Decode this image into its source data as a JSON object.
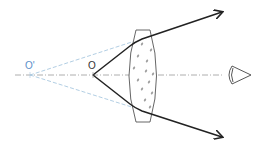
{
  "diagram": {
    "type": "optics-ray-diagram",
    "labels": {
      "virtual_image": "O'",
      "object": "O"
    },
    "elements": [
      {
        "name": "principal-axis",
        "style": "dash-dot",
        "color": "#9a9a9a"
      },
      {
        "name": "convex-lens",
        "style": "outline with dotted texture",
        "color": "#555555"
      },
      {
        "name": "upper-ray",
        "style": "solid arrow",
        "color": "#222222"
      },
      {
        "name": "lower-ray",
        "style": "solid arrow",
        "color": "#222222"
      },
      {
        "name": "upper-extension",
        "style": "dashed",
        "color": "#a9c8e0"
      },
      {
        "name": "lower-extension",
        "style": "dashed",
        "color": "#a9c8e0"
      },
      {
        "name": "eye",
        "style": "outline",
        "color": "#444444"
      }
    ],
    "colors": {
      "ray": "#222222",
      "extension": "#a9c8e0",
      "axis": "#9a9a9a",
      "lens": "#555555",
      "lens_dots": "#9a9a9a",
      "virtual_label": "#5b8fc9",
      "object_label": "#333333"
    }
  }
}
